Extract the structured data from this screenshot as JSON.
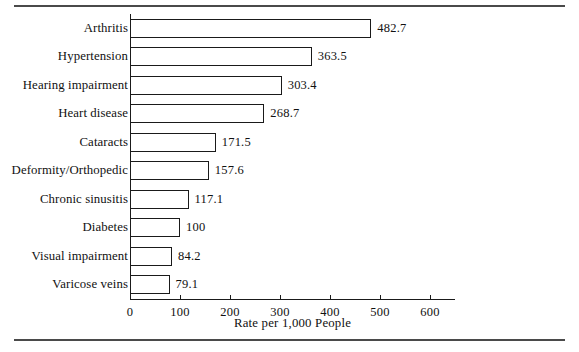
{
  "chart_data": {
    "type": "bar",
    "orientation": "horizontal",
    "title": "",
    "xlabel": "Rate per 1,000 People",
    "ylabel": "",
    "xlim": [
      0,
      650
    ],
    "grid": false,
    "legend": null,
    "xticks": [
      0,
      100,
      200,
      300,
      400,
      500,
      600
    ],
    "xtick_labels": [
      "0",
      "100",
      "200",
      "300",
      "400",
      "500",
      "600"
    ],
    "categories": [
      "Arthritis",
      "Hypertension",
      "Hearing impairment",
      "Heart disease",
      "Cataracts",
      "Deformity/Orthopedic",
      "Chronic sinusitis",
      "Diabetes",
      "Visual impairment",
      "Varicose veins"
    ],
    "values": [
      482.7,
      363.5,
      303.4,
      268.7,
      171.5,
      157.6,
      117.1,
      100,
      84.2,
      79.1
    ],
    "value_labels": [
      "482.7",
      "363.5",
      "303.4",
      "268.7",
      "171.5",
      "157.6",
      "117.1",
      "100",
      "84.2",
      "79.1"
    ],
    "bar_fill": "#ffffff",
    "bar_edge": "#1a1a1a"
  },
  "figure": {
    "rule_color": "#4a4a4a"
  }
}
